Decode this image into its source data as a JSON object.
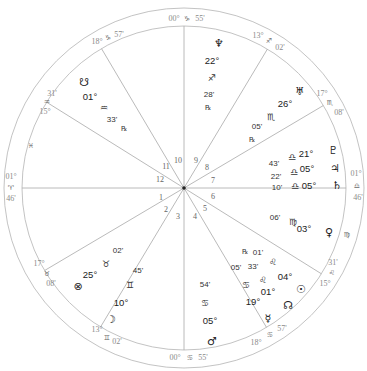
{
  "chart_title": "Natal wheel",
  "geometry": {
    "cx": 184,
    "cy": 188,
    "r_outer": 180,
    "r_inner": 162
  },
  "colors": {
    "ring": "#b4b4b4",
    "line": "#a8a8a8",
    "text": "#222222",
    "cusp_text": "#8a8a8a"
  },
  "cusps": [
    {
      "house": 1,
      "deg": "01°",
      "sign": "♈",
      "min": "46'",
      "angle_deg": 180,
      "deg_pos": [
        11,
        179
      ],
      "sign_pos": [
        11,
        190
      ],
      "min_pos": [
        11,
        201
      ],
      "house_pos": [
        161,
        200
      ]
    },
    {
      "house": 2,
      "deg": "17°",
      "sign": "♉",
      "min": "08'",
      "angle_deg": 210.6,
      "deg_pos": [
        39,
        266
      ],
      "sign_pos": [
        47,
        276
      ],
      "min_pos": [
        51,
        286
      ],
      "house_pos": [
        166,
        212
      ]
    },
    {
      "house": 3,
      "deg": "13°",
      "sign": "♊",
      "min": "02'",
      "angle_deg": 239,
      "deg_pos": [
        97,
        332
      ],
      "sign_pos": [
        107,
        340
      ],
      "min_pos": [
        117,
        344
      ],
      "house_pos": [
        178,
        219
      ]
    },
    {
      "house": 4,
      "deg": "00°",
      "sign": "♋",
      "min": "55'",
      "angle_deg": 270,
      "deg_pos": [
        175,
        360
      ],
      "sign_pos": [
        190,
        360
      ],
      "min_pos": [
        203,
        360
      ],
      "house_pos": [
        195,
        219
      ]
    },
    {
      "house": 5,
      "deg": "18°",
      "sign": "♋",
      "min": "57'",
      "angle_deg": 300.6,
      "deg_pos": [
        256,
        345
      ],
      "sign_pos": [
        270,
        337
      ],
      "min_pos": [
        282,
        331
      ],
      "house_pos": [
        205,
        211
      ]
    },
    {
      "house": 6,
      "deg": "15°",
      "sign": "♌",
      "min": "31'",
      "angle_deg": 328,
      "deg_pos": [
        325,
        286
      ],
      "sign_pos": [
        332,
        275
      ],
      "min_pos": [
        333,
        265
      ],
      "house_pos": [
        213,
        199
      ]
    },
    {
      "house": 7,
      "deg": "01°",
      "sign": "♎",
      "min": "46'",
      "angle_deg": 0,
      "deg_pos": [
        356,
        176
      ],
      "sign_pos": [
        357,
        188
      ],
      "min_pos": [
        358,
        200
      ],
      "house_pos": [
        213,
        183
      ]
    },
    {
      "house": 8,
      "deg": "17°",
      "sign": "♏",
      "min": "08'",
      "angle_deg": 30.6,
      "deg_pos": [
        322,
        96
      ],
      "sign_pos": [
        330,
        105
      ],
      "min_pos": [
        339,
        115
      ],
      "house_pos": [
        207,
        170
      ]
    },
    {
      "house": 9,
      "deg": "13°",
      "sign": "♐",
      "min": "02'",
      "angle_deg": 59,
      "deg_pos": [
        258,
        38
      ],
      "sign_pos": [
        269,
        43
      ],
      "min_pos": [
        280,
        50
      ],
      "house_pos": [
        196,
        163
      ]
    },
    {
      "house": 10,
      "deg": "00°",
      "sign": "♑",
      "min": "55'",
      "angle_deg": 90,
      "deg_pos": [
        174,
        21
      ],
      "sign_pos": [
        187,
        21
      ],
      "min_pos": [
        200,
        21
      ],
      "house_pos": [
        178,
        163
      ]
    },
    {
      "house": 11,
      "deg": "18°",
      "sign": "♑",
      "min": "57'",
      "angle_deg": 120.6,
      "deg_pos": [
        97,
        44
      ],
      "sign_pos": [
        108,
        40
      ],
      "min_pos": [
        119,
        37
      ],
      "house_pos": [
        166,
        169
      ]
    },
    {
      "house": 12,
      "deg": "15°",
      "sign": "♒",
      "min": "31'",
      "angle_deg": 148,
      "deg_pos": [
        45,
        114
      ],
      "sign_pos": [
        47,
        104
      ],
      "min_pos": [
        52,
        96
      ],
      "house_pos": [
        160,
        182
      ]
    }
  ],
  "intercepted_signs": [
    {
      "sign": "♓",
      "pos": [
        31,
        148
      ]
    },
    {
      "sign": "♍",
      "pos": [
        347,
        237
      ]
    }
  ],
  "planets": [
    {
      "name": "South Node",
      "glyph": "☋",
      "deg": "01°",
      "sign": "♒",
      "min": "33'",
      "retro": "℞",
      "glyph_pos": [
        84,
        86
      ],
      "deg_pos": [
        90,
        100
      ],
      "sign_pos": [
        104,
        111
      ],
      "min_pos": [
        112,
        122
      ],
      "retro_pos": [
        124,
        131
      ]
    },
    {
      "name": "Neptune",
      "glyph": "♆",
      "deg": "22°",
      "sign": "♐",
      "min": "28'",
      "retro": "℞",
      "glyph_pos": [
        219,
        47
      ],
      "deg_pos": [
        212,
        64
      ],
      "sign_pos": [
        212,
        81
      ],
      "min_pos": [
        209,
        97
      ],
      "retro_pos": [
        208,
        110
      ]
    },
    {
      "name": "Uranus",
      "glyph": "♅",
      "deg": "26°",
      "sign": "♏",
      "min": "05'",
      "retro": "℞",
      "glyph_pos": [
        300,
        95
      ],
      "deg_pos": [
        285,
        107
      ],
      "sign_pos": [
        271,
        120
      ],
      "min_pos": [
        257,
        129
      ],
      "retro_pos": [
        252,
        142
      ]
    },
    {
      "name": "Pluto",
      "glyph": "♇",
      "deg": "21°",
      "sign": "♎",
      "min": "43'",
      "retro": "",
      "glyph_pos": [
        333,
        154
      ],
      "deg_pos": [
        306,
        157
      ],
      "sign_pos": [
        292,
        160
      ],
      "min_pos": [
        274,
        166
      ],
      "retro_pos": [
        0,
        0
      ]
    },
    {
      "name": "Jupiter",
      "glyph": "♃",
      "deg": "05°",
      "sign": "♎",
      "min": "22'",
      "retro": "",
      "glyph_pos": [
        335,
        172
      ],
      "deg_pos": [
        307,
        172
      ],
      "sign_pos": [
        294,
        175
      ],
      "min_pos": [
        276,
        179
      ],
      "retro_pos": [
        0,
        0
      ]
    },
    {
      "name": "Saturn",
      "glyph": "♄",
      "deg": "05°",
      "sign": "♎",
      "min": "10'",
      "retro": "",
      "glyph_pos": [
        337,
        189
      ],
      "deg_pos": [
        309,
        189
      ],
      "sign_pos": [
        295,
        189
      ],
      "min_pos": [
        277,
        190
      ],
      "retro_pos": [
        0,
        0
      ]
    },
    {
      "name": "Venus",
      "glyph": "♀",
      "deg": "03°",
      "sign": "♍",
      "min": "06'",
      "retro": "",
      "glyph_pos": [
        329,
        236
      ],
      "deg_pos": [
        304,
        232
      ],
      "sign_pos": [
        293,
        225
      ],
      "min_pos": [
        275,
        220
      ],
      "retro_pos": [
        0,
        0
      ]
    },
    {
      "name": "Sun",
      "glyph": "☉",
      "deg": "04°",
      "sign": "♌",
      "min": "33'",
      "retro": "",
      "glyph_pos": [
        301,
        293
      ],
      "deg_pos": [
        285,
        280
      ],
      "sign_pos": [
        273,
        265
      ],
      "min_pos": [
        253,
        269
      ],
      "retro_pos": [
        0,
        0
      ]
    },
    {
      "name": "North Node",
      "glyph": "☊",
      "deg": "01°",
      "sign": "♌",
      "min": "01'",
      "retro": "℞",
      "glyph_pos": [
        288,
        309
      ],
      "deg_pos": [
        268,
        295
      ],
      "sign_pos": [
        263,
        283
      ],
      "min_pos": [
        258,
        255
      ],
      "retro_pos": [
        245,
        254
      ]
    },
    {
      "name": "Mercury",
      "glyph": "☿",
      "deg": "19°",
      "sign": "♋",
      "min": "05'",
      "retro": "",
      "glyph_pos": [
        268,
        322
      ],
      "deg_pos": [
        253,
        305
      ],
      "sign_pos": [
        246,
        288
      ],
      "min_pos": [
        236,
        270
      ],
      "retro_pos": [
        0,
        0
      ]
    },
    {
      "name": "Mars",
      "glyph": "♂",
      "deg": "05°",
      "sign": "♋",
      "min": "54'",
      "retro": "",
      "glyph_pos": [
        212,
        345
      ],
      "deg_pos": [
        210,
        324
      ],
      "sign_pos": [
        205,
        306
      ],
      "min_pos": [
        205,
        287
      ],
      "retro_pos": [
        0,
        0
      ]
    },
    {
      "name": "Moon",
      "glyph": "☽",
      "deg": "10°",
      "sign": "♊",
      "min": "45'",
      "retro": "",
      "glyph_pos": [
        111,
        323
      ],
      "deg_pos": [
        121,
        306
      ],
      "sign_pos": [
        130,
        288
      ],
      "min_pos": [
        138,
        273
      ],
      "retro_pos": [
        0,
        0
      ]
    },
    {
      "name": "Part of Fortune",
      "glyph": "⊗",
      "deg": "25°",
      "sign": "♉",
      "min": "02'",
      "retro": "",
      "glyph_pos": [
        78,
        290
      ],
      "deg_pos": [
        90,
        278
      ],
      "sign_pos": [
        106,
        267
      ],
      "min_pos": [
        118,
        253
      ],
      "retro_pos": [
        0,
        0
      ]
    }
  ]
}
